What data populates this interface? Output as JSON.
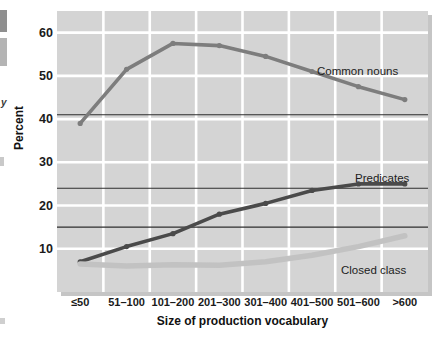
{
  "chart_data": {
    "type": "line",
    "title": "",
    "xlabel": "Size of production vocabulary",
    "ylabel": "Percent",
    "categories": [
      "≤50",
      "51–100",
      "101–200",
      "201–300",
      "301–400",
      "401–500",
      "501–600",
      ">600"
    ],
    "yticks": [
      10,
      20,
      30,
      40,
      50,
      60
    ],
    "ylim": [
      0,
      65
    ],
    "grid": true,
    "legend_position": "inline-right",
    "series": [
      {
        "name": "Common nouns",
        "color": "#7d7d7d",
        "values": [
          39,
          51.5,
          57.5,
          57,
          54.5,
          51,
          47.5,
          44.5
        ]
      },
      {
        "name": "Predicates",
        "color": "#4a4a4a",
        "values": [
          7,
          10.5,
          13.5,
          18,
          20.5,
          23.5,
          25,
          25
        ]
      },
      {
        "name": "Closed class",
        "color": "#c2c2c2",
        "values": [
          6.5,
          6,
          6.3,
          6.2,
          7,
          8.5,
          10.5,
          13
        ]
      }
    ],
    "reference_lines": [
      41,
      24,
      15
    ],
    "annotations": [
      {
        "name": "common-nouns",
        "text": "Common nouns"
      },
      {
        "name": "predicates",
        "text": "Predicates"
      },
      {
        "name": "closed-class",
        "text": "Closed class"
      }
    ],
    "plot_background": "#d4d4d4",
    "gridline_color": "#ffffff",
    "reference_line_color": "#2e2e2e"
  },
  "edge": {
    "partial_letter": "y",
    "source_note": ""
  }
}
